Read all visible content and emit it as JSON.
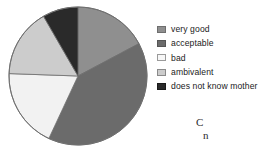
{
  "chart_data": {
    "type": "pie",
    "title": "",
    "subtitle": "",
    "xlabel": "",
    "ylabel": "",
    "grid": false,
    "legend_position": "right",
    "categories": [
      "very good",
      "acceptable",
      "bad",
      "ambivalent",
      "does not know mother"
    ],
    "values": [
      17.2,
      39.7,
      18.6,
      16.1,
      8.4
    ],
    "units": "percent",
    "start_angle_deg": 0,
    "direction": "clockwise",
    "slices": [
      {
        "label": "very good",
        "value": 17.2,
        "start_angle_deg": 0,
        "end_angle_deg": 62,
        "color": "#8f8f8f"
      },
      {
        "label": "acceptable",
        "value": 39.7,
        "start_angle_deg": 62,
        "end_angle_deg": 205,
        "color": "#6b6b6b"
      },
      {
        "label": "bad",
        "value": 18.6,
        "start_angle_deg": 205,
        "end_angle_deg": 272,
        "color": "#f2f2f2"
      },
      {
        "label": "ambivalent",
        "value": 16.1,
        "start_angle_deg": 272,
        "end_angle_deg": 330,
        "color": "#cccccc"
      },
      {
        "label": "does not know mother",
        "value": 8.4,
        "start_angle_deg": 330,
        "end_angle_deg": 360,
        "color": "#2a2a2a"
      }
    ],
    "geometry": {
      "center_x": 78,
      "center_y": 76,
      "radius": 69,
      "outline_color": "#6e6e6e"
    }
  },
  "legend": {
    "items": [
      {
        "label": "very good",
        "color": "#8f8f8f",
        "border": "#6e6e6e"
      },
      {
        "label": "acceptable",
        "color": "#6b6b6b",
        "border": "#555555"
      },
      {
        "label": "bad",
        "color": "#f7f7f7",
        "border": "#9a9a9a"
      },
      {
        "label": "ambivalent",
        "color": "#cccccc",
        "border": "#8a8a8a"
      },
      {
        "label": "does not know mother",
        "color": "#2a2a2a",
        "border": "#1a1a1a"
      }
    ]
  },
  "caption": {
    "line1": "C",
    "line2": "n"
  }
}
